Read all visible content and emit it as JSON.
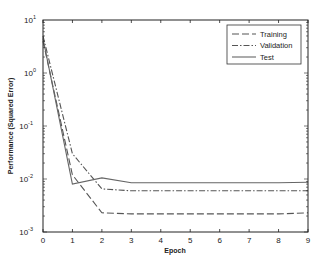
{
  "chart_data": {
    "type": "line",
    "title": "",
    "xlabel": "Epoch",
    "ylabel": "Performance (Squared Error)",
    "xlim": [
      0,
      9
    ],
    "ylim": [
      0.001,
      10
    ],
    "yscale": "log",
    "grid": false,
    "legend_position": "upper right",
    "x_ticks": [
      "0",
      "1",
      "2",
      "3",
      "4",
      "5",
      "6",
      "7",
      "8",
      "9"
    ],
    "y_ticks": [
      {
        "base": "10",
        "exp": "1"
      },
      {
        "base": "10",
        "exp": "0"
      },
      {
        "base": "10",
        "exp": "-1"
      },
      {
        "base": "10",
        "exp": "-2"
      },
      {
        "base": "10",
        "exp": "-3"
      }
    ],
    "x": [
      0,
      1,
      2,
      3,
      4,
      5,
      6,
      7,
      8,
      9
    ],
    "series": [
      {
        "name": "Training",
        "style": "dashed",
        "color": "#555555",
        "values": [
          4.0,
          0.012,
          0.0023,
          0.0022,
          0.0022,
          0.0022,
          0.0022,
          0.0022,
          0.0022,
          0.0023
        ]
      },
      {
        "name": "Validation",
        "style": "dashdot",
        "color": "#555555",
        "values": [
          5.0,
          0.03,
          0.0065,
          0.006,
          0.006,
          0.006,
          0.006,
          0.006,
          0.006,
          0.006
        ]
      },
      {
        "name": "Test",
        "style": "solid",
        "color": "#666666",
        "values": [
          4.5,
          0.008,
          0.0105,
          0.0085,
          0.0085,
          0.0085,
          0.0085,
          0.0085,
          0.0085,
          0.0087
        ]
      }
    ]
  }
}
